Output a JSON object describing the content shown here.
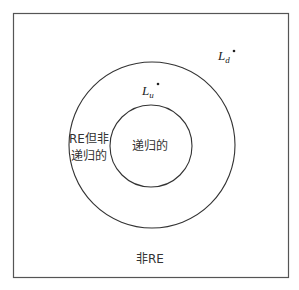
{
  "diagram": {
    "regions": {
      "recursive": "递归的",
      "re_not_recursive_line1": "RE但非",
      "re_not_recursive_line2": "递归的",
      "non_re": "非RE"
    },
    "points": {
      "lu": {
        "symbol": "L",
        "subscript": "u"
      },
      "ld": {
        "symbol": "L",
        "subscript": "d"
      }
    },
    "colors": {
      "stroke": "#333333",
      "frame": "#555555",
      "background": "#ffffff"
    }
  }
}
